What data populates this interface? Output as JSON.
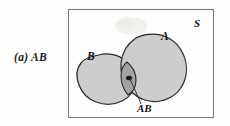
{
  "figure": {
    "caption": "(a) AB",
    "caption_part_label": "(a)",
    "caption_expression": "AB",
    "type": "venn-diagram"
  },
  "labels": {
    "sample_space": "S",
    "set_a": "A",
    "set_b": "B",
    "intersection": "AB"
  },
  "colors": {
    "page_background": "#fdfdfc",
    "frame_border": "#7d7d7d",
    "set_fill": "#cdcdcd",
    "set_outline": "#2a2a2a",
    "intersection_fill": "#a2a2a2",
    "intersection_dot": "#1a1a1a",
    "leader_line": "#2a2a2a",
    "text": "#151515",
    "smudge": "#efeeea"
  },
  "geometry": {
    "frame": {
      "x": 68,
      "y": 9,
      "width": 146,
      "height": 109
    },
    "label_positions": {
      "sample_space": {
        "x": 194,
        "y": 27
      },
      "set_a": {
        "x": 161,
        "y": 40
      },
      "set_b": {
        "x": 87,
        "y": 60
      },
      "intersection": {
        "x": 137,
        "y": 112
      }
    },
    "leader_line": {
      "x1": 133,
      "y1": 72,
      "x2": 141,
      "y2": 104
    }
  }
}
